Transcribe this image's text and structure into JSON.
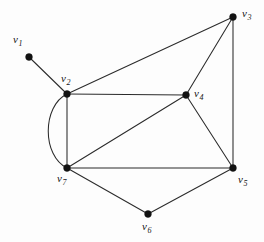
{
  "figure": {
    "background_color": "#fdfdfd",
    "edge_color": "#2b2b2b",
    "vertex_color": "#121212",
    "width": 264,
    "height": 242
  },
  "chart_data": {
    "type": "diagram",
    "title": "",
    "graph_kind": "undirected graph",
    "vertex_count": 7,
    "edge_count": 12,
    "vertices": [
      {
        "id": "v1",
        "label_main": "v",
        "label_sub": "1",
        "x": 29,
        "y": 57,
        "label_x": 13,
        "label_y": 34,
        "degree": 1
      },
      {
        "id": "v2",
        "label_main": "v",
        "label_sub": "2",
        "x": 67,
        "y": 94,
        "label_x": 61,
        "label_y": 73,
        "degree": 5
      },
      {
        "id": "v3",
        "label_main": "v",
        "label_sub": "3",
        "x": 233,
        "y": 17,
        "label_x": 242,
        "label_y": 8,
        "degree": 3
      },
      {
        "id": "v4",
        "label_main": "v",
        "label_sub": "4",
        "x": 186,
        "y": 95,
        "label_x": 194,
        "label_y": 88,
        "degree": 5
      },
      {
        "id": "v5",
        "label_main": "v",
        "label_sub": "5",
        "x": 233,
        "y": 168,
        "label_x": 238,
        "label_y": 174,
        "degree": 5
      },
      {
        "id": "v6",
        "label_main": "v",
        "label_sub": "6",
        "x": 148,
        "y": 214,
        "label_x": 142,
        "label_y": 221,
        "degree": 2
      },
      {
        "id": "v7",
        "label_main": "v",
        "label_sub": "7",
        "x": 67,
        "y": 168,
        "label_x": 57,
        "label_y": 173,
        "degree": 6
      }
    ],
    "edges": [
      {
        "from": "v1",
        "to": "v2",
        "shape": "straight"
      },
      {
        "from": "v2",
        "to": "v3",
        "shape": "straight"
      },
      {
        "from": "v2",
        "to": "v4",
        "shape": "straight"
      },
      {
        "from": "v2",
        "to": "v7",
        "shape": "straight"
      },
      {
        "from": "v2",
        "to": "v7",
        "shape": "arc",
        "bulge": "left",
        "control_x": 16,
        "note": "parallel curved edge"
      },
      {
        "from": "v3",
        "to": "v4",
        "shape": "straight"
      },
      {
        "from": "v3",
        "to": "v5",
        "shape": "straight"
      },
      {
        "from": "v4",
        "to": "v5",
        "shape": "straight"
      },
      {
        "from": "v4",
        "to": "v7",
        "shape": "straight"
      },
      {
        "from": "v5",
        "to": "v6",
        "shape": "straight"
      },
      {
        "from": "v5",
        "to": "v7",
        "shape": "straight"
      },
      {
        "from": "v6",
        "to": "v7",
        "shape": "straight"
      }
    ]
  }
}
